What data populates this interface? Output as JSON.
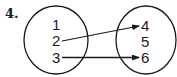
{
  "problem": {
    "number": "4."
  },
  "domain_set": {
    "elements": [
      "1",
      "2",
      "3"
    ]
  },
  "range_set": {
    "elements": [
      "4",
      "5",
      "6"
    ]
  },
  "mappings": [
    {
      "from": "2",
      "to": "4"
    },
    {
      "from": "3",
      "to": "6"
    }
  ],
  "colors": {
    "stroke": "#1a1a1a",
    "background": "#ffffff"
  }
}
